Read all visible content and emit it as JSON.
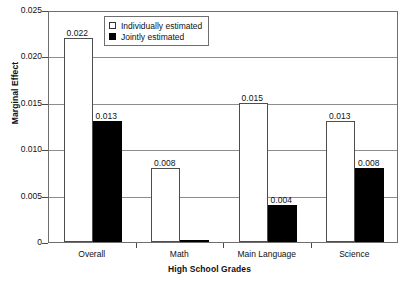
{
  "chart_data": {
    "type": "bar",
    "title": "",
    "subtitle": "",
    "xlabel": "High School Grades",
    "ylabel": "Marginal Effect",
    "categories": [
      "Overall",
      "Math",
      "Main Language",
      "Science"
    ],
    "series": [
      {
        "name": "Individually estimated",
        "values": [
          0.022,
          0.008,
          0.015,
          0.013
        ],
        "labels": [
          "0.022",
          "0.008",
          "0.015",
          "0.013"
        ],
        "color": "#ffffff",
        "edge_color": "#4d4d4d",
        "fill": "hollow"
      },
      {
        "name": "Jointly estimated",
        "values": [
          0.013,
          0.0002,
          0.004,
          0.008
        ],
        "labels": [
          "0.013",
          "",
          "0.004",
          "0.008"
        ],
        "color": "#000000",
        "edge_color": "#000000",
        "fill": "solid"
      }
    ],
    "ylim": [
      0,
      0.025
    ],
    "yticks": [
      0,
      0.005,
      0.01,
      0.015,
      0.02,
      0.025
    ],
    "ytick_labels": [
      "0",
      "0.005",
      "0.010",
      "0.015",
      "0.020",
      "0.025"
    ],
    "grid": true,
    "grid_axis": "y",
    "legend_position": "top-center",
    "legend": [
      "Individually estimated",
      "Jointly estimated"
    ]
  },
  "axes": {
    "y_title": "Marginal Effect",
    "x_title": "High School Grades"
  }
}
